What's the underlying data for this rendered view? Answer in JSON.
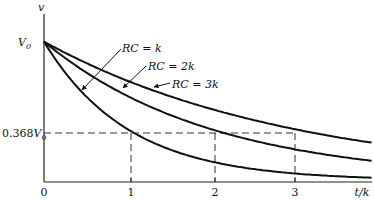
{
  "chart_data": {
    "type": "line",
    "title": "",
    "xlabel": "t/k",
    "ylabel": "v",
    "x_ticks": [
      "0",
      "1",
      "2",
      "3"
    ],
    "y_ticks": [
      "0.368V0",
      "V0"
    ],
    "xlim": [
      0,
      3.9
    ],
    "ylim": [
      0,
      1
    ],
    "grid": false,
    "annotations": [
      {
        "text": "RC = k",
        "points_to": "series 0"
      },
      {
        "text": "RC = 2k",
        "points_to": "series 1"
      },
      {
        "text": "RC = 3k",
        "points_to": "series 2"
      },
      {
        "text": "dashed line at 0.368V0 with drops at t/k = 1, 2, 3"
      }
    ],
    "series": [
      {
        "name": "RC = k",
        "function": "V0*exp(-t/k)",
        "x": [
          0,
          0.5,
          1,
          1.5,
          2,
          2.5,
          3,
          3.5,
          3.9
        ],
        "y": [
          1,
          0.607,
          0.368,
          0.223,
          0.135,
          0.082,
          0.05,
          0.03,
          0.02
        ]
      },
      {
        "name": "RC = 2k",
        "function": "V0*exp(-t/2k)",
        "x": [
          0,
          0.5,
          1,
          1.5,
          2,
          2.5,
          3,
          3.5,
          3.9
        ],
        "y": [
          1,
          0.779,
          0.607,
          0.472,
          0.368,
          0.287,
          0.223,
          0.174,
          0.142
        ]
      },
      {
        "name": "RC = 3k",
        "function": "V0*exp(-t/3k)",
        "x": [
          0,
          0.5,
          1,
          1.5,
          2,
          2.5,
          3,
          3.5,
          3.9
        ],
        "y": [
          1,
          0.846,
          0.717,
          0.607,
          0.513,
          0.435,
          0.368,
          0.311,
          0.273
        ]
      }
    ]
  },
  "labels": {
    "y_axis": "v",
    "x_axis": "t/k",
    "v0": "V",
    "v0_sub": "0",
    "level_num": "0.368",
    "level_v": "V",
    "level_sub": "0",
    "origin": "0",
    "tick1": "1",
    "tick2": "2",
    "tick3": "3",
    "rc_k": "RC = k",
    "rc_2k": "RC = 2k",
    "rc_3k": "RC = 3k"
  }
}
